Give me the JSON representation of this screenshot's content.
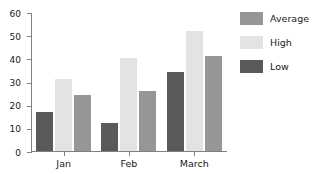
{
  "chart_data": {
    "type": "bar",
    "title": "",
    "xlabel": "",
    "ylabel": "",
    "categories": [
      "Jan",
      "Feb",
      "March"
    ],
    "series": [
      {
        "name": "Low",
        "values": [
          17,
          12,
          34
        ],
        "color": "#5a5a5a"
      },
      {
        "name": "High",
        "values": [
          31,
          40,
          52
        ],
        "color": "#e3e3e3"
      },
      {
        "name": "Average",
        "values": [
          24,
          26,
          41
        ],
        "color": "#969696"
      }
    ],
    "bar_order_in_group": [
      "Low",
      "High",
      "Average"
    ],
    "ylim": [
      0,
      60
    ],
    "ytick_labels": [
      "60",
      "50",
      "40",
      "30",
      "20",
      "10",
      "0"
    ],
    "ytick_values": [
      60,
      50,
      40,
      30,
      20,
      10,
      0
    ],
    "grid": false,
    "legend_position": "right",
    "legend": [
      {
        "label": "Average",
        "color": "#969696"
      },
      {
        "label": "High",
        "color": "#e3e3e3"
      },
      {
        "label": "Low",
        "color": "#5a5a5a"
      }
    ],
    "axis_color": "#808080",
    "background_color": "#ffffff",
    "text_color": "#1a1a1a"
  }
}
